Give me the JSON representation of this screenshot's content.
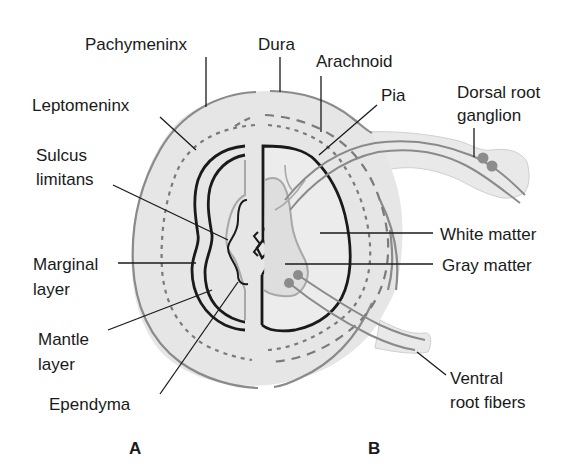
{
  "figure": {
    "panels": [
      {
        "id": "A",
        "label": "A"
      },
      {
        "id": "B",
        "label": "B"
      }
    ],
    "labels": {
      "pachymeninx": "Pachymeninx",
      "dura": "Dura",
      "arachnoid": "Arachnoid",
      "pia": "Pia",
      "leptomeninx": "Leptomeninx",
      "dorsal_root_ganglion_1": "Dorsal root",
      "dorsal_root_ganglion_2": "ganglion",
      "sulcus_limitans_1": "Sulcus",
      "sulcus_limitans_2": "limitans",
      "white_matter": "White matter",
      "gray_matter": "Gray matter",
      "marginal_layer_1": "Marginal",
      "marginal_layer_2": "layer",
      "mantle_layer_1": "Mantle",
      "mantle_layer_2": "layer",
      "ependyma": "Ependyma",
      "ventral_root_fibers_1": "Ventral",
      "ventral_root_fibers_2": "root fibers"
    },
    "colors": {
      "meninges_fill": "#e6e6e6",
      "cord_fill": "#eeeeee",
      "gray_matter_fill": "#dcdcdc",
      "outline_gray": "#8a8a8a",
      "dashed_gray": "#7a7a7a",
      "ganglion_dot": "#8c8c8c",
      "ink": "#1a1a1a"
    }
  }
}
